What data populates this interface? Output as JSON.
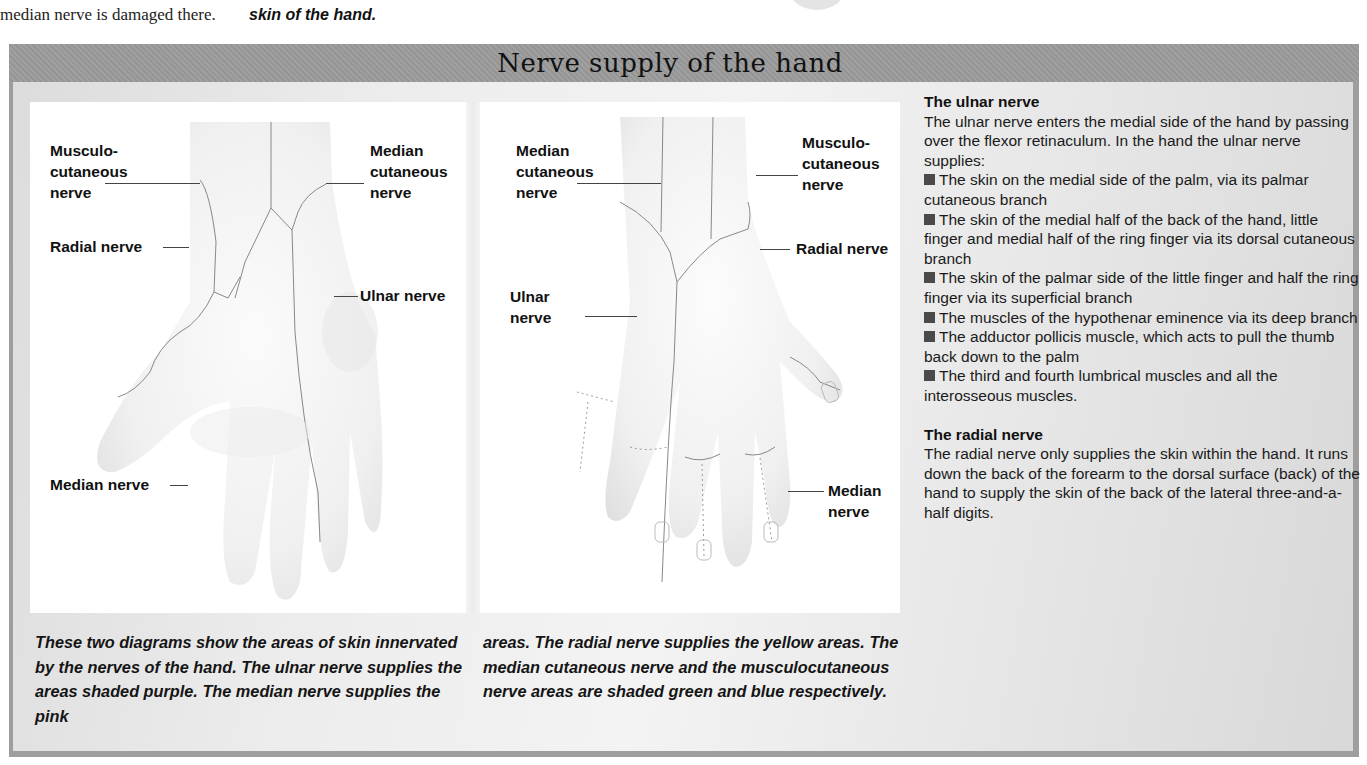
{
  "page_top": {
    "left_fragment": "median nerve is damaged there.",
    "middle_fragment": "skin of the hand."
  },
  "panel": {
    "title": "Nerve supply of the hand",
    "colors": {
      "header_band": "#9b9b9b",
      "body_gradient_light": "#f3f3f3",
      "body_gradient_dark": "#d8d8d8",
      "bullet": "#4a4a4a"
    }
  },
  "diagram_left": {
    "labels": {
      "musculocutaneous": "Musculo-\ncutaneous\nnerve",
      "median_cutaneous": "Median\ncutaneous\nnerve",
      "radial": "Radial nerve",
      "ulnar": "Ulnar nerve",
      "median": "Median nerve"
    }
  },
  "diagram_right": {
    "labels": {
      "median_cutaneous": "Median\ncutaneous\nnerve",
      "musculocutaneous": "Musculo-\ncutaneous\nnerve",
      "radial": "Radial nerve",
      "ulnar": "Ulnar\nnerve",
      "median": "Median\nnerve"
    }
  },
  "captions": {
    "left": "These two diagrams show the areas of skin innervated by the nerves of the hand. The ulnar nerve supplies the areas shaded purple. The median nerve supplies the pink",
    "right": "areas. The radial nerve supplies the yellow areas. The median cutaneous nerve and the musculocutaneous nerve areas are shaded green and blue respectively."
  },
  "ulnar_section": {
    "heading": "The ulnar nerve",
    "intro": "The ulnar nerve enters the medial side of the hand by passing over the flexor retinaculum. In the hand the ulnar nerve supplies:",
    "bullets": [
      "The skin on the medial side of the palm, via its palmar cutaneous branch",
      "The skin of the medial half of the back of the hand, little finger and medial half of the ring finger via its dorsal cutaneous branch",
      "The skin of the palmar side of the little finger and half the ring finger via its superficial branch",
      "The muscles of the hypothenar eminence via its deep branch",
      "The adductor pollicis muscle, which acts to pull the thumb back down to the palm",
      "The third and fourth lumbrical muscles and all the interosseous muscles."
    ]
  },
  "radial_section": {
    "heading": "The radial nerve",
    "body": "The radial nerve only supplies the skin within the hand. It runs down the back of the forearm to the dorsal surface (back) of the hand to supply the skin of the back of the lateral three-and-a-half digits."
  }
}
